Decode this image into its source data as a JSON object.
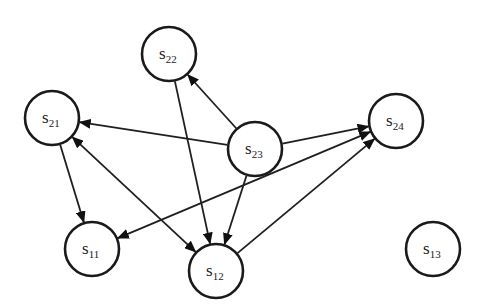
{
  "diagram": {
    "type": "directed-graph",
    "stroke_color": "#1a1a1a",
    "background": "#ffffff",
    "nodes": [
      {
        "id": "s22",
        "base": "s",
        "sub": "22",
        "x": 169,
        "y": 54,
        "r": 27
      },
      {
        "id": "s21",
        "base": "s",
        "sub": "21",
        "x": 52,
        "y": 118,
        "r": 27
      },
      {
        "id": "s23",
        "base": "s",
        "sub": "23",
        "x": 255,
        "y": 149,
        "r": 27
      },
      {
        "id": "s24",
        "base": "s",
        "sub": "24",
        "x": 396,
        "y": 121,
        "r": 27
      },
      {
        "id": "s11",
        "base": "s",
        "sub": "11",
        "x": 92,
        "y": 249,
        "r": 27
      },
      {
        "id": "s12",
        "base": "s",
        "sub": "12",
        "x": 216,
        "y": 271,
        "r": 27
      },
      {
        "id": "s13",
        "base": "s",
        "sub": "13",
        "x": 433,
        "y": 249,
        "r": 27
      }
    ],
    "edges": [
      {
        "from": "s23",
        "to": "s22",
        "bidirectional": false
      },
      {
        "from": "s23",
        "to": "s21",
        "bidirectional": false
      },
      {
        "from": "s23",
        "to": "s24",
        "bidirectional": false
      },
      {
        "from": "s23",
        "to": "s12",
        "bidirectional": false
      },
      {
        "from": "s22",
        "to": "s12",
        "bidirectional": false
      },
      {
        "from": "s21",
        "to": "s11",
        "bidirectional": false
      },
      {
        "from": "s21",
        "to": "s12",
        "bidirectional": true
      },
      {
        "from": "s11",
        "to": "s24",
        "bidirectional": true
      },
      {
        "from": "s12",
        "to": "s24",
        "bidirectional": false
      }
    ]
  }
}
